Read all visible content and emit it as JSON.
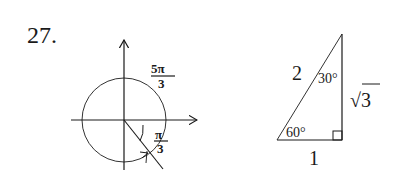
{
  "problem": {
    "number": "27."
  },
  "unit_circle": {
    "angle_label_outer": {
      "numerator": "5π",
      "denominator": "3"
    },
    "angle_label_inner": {
      "numerator": "π",
      "denominator": "3"
    }
  },
  "triangle": {
    "hypotenuse_label": "2",
    "top_angle_label": "30°",
    "vertical_side_label": "√3",
    "bottom_angle_label": "60°",
    "base_label": "1"
  },
  "colors": {
    "ink": "#1a1a1a",
    "background": "#ffffff"
  }
}
